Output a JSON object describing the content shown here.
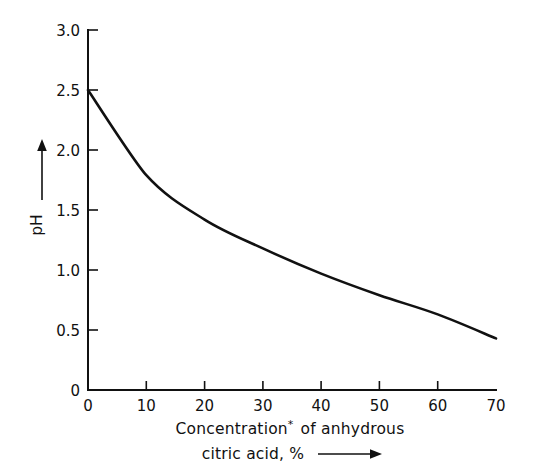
{
  "chart_data": {
    "type": "line",
    "title": "",
    "subtitle": "",
    "xlabel_line1": "Concentration",
    "xlabel_sup": "*",
    "xlabel_line1_rest": " of anhydrous",
    "xlabel_line2": "citric acid, %",
    "xlabel_full": "Concentration* of anhydrous citric acid, %",
    "ylabel": "pH",
    "x": [
      0,
      10,
      20,
      30,
      40,
      50,
      60,
      70
    ],
    "values": [
      2.5,
      1.79,
      1.42,
      1.18,
      0.97,
      0.79,
      0.63,
      0.43
    ],
    "series": [
      {
        "name": "pH of aqueous citric acid solution",
        "values": [
          2.5,
          1.79,
          1.42,
          1.18,
          0.97,
          0.79,
          0.63,
          0.43
        ]
      }
    ],
    "xlim": [
      0,
      70
    ],
    "ylim": [
      0,
      3.0
    ],
    "xticks": [
      0,
      10,
      20,
      30,
      40,
      50,
      60,
      70
    ],
    "xtick_labels": [
      "0",
      "10",
      "20",
      "30",
      "40",
      "50",
      "60",
      "70"
    ],
    "yticks": [
      0,
      0.5,
      1.0,
      1.5,
      2.0,
      2.5,
      3.0
    ],
    "ytick_labels": [
      "0",
      "0.5",
      "1.0",
      "1.5",
      "2.0",
      "2.5",
      "3.0"
    ],
    "grid": false,
    "legend": false,
    "legend_position": "none",
    "line_color": "#111111",
    "background_color": "#ffffff",
    "x_axis_arrow": true,
    "y_axis_arrow": true
  },
  "axes": {
    "y_tick_labels": [
      "3.0",
      "2.5",
      "2.0",
      "1.5",
      "1.0",
      "0.5",
      "0"
    ],
    "x_tick_labels": [
      "0",
      "10",
      "20",
      "30",
      "40",
      "50",
      "60",
      "70"
    ]
  },
  "labels": {
    "y_axis_title": "pH",
    "x_axis_title_line1_a": "Concentration",
    "x_axis_title_line1_sup": "*",
    "x_axis_title_line1_b": "of anhydrous",
    "x_axis_title_line2": "citric acid, %"
  }
}
